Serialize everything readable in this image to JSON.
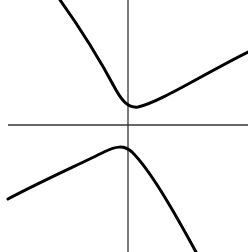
{
  "figure": {
    "type": "hyperbola-sketch",
    "colors": {
      "background": "#ffffff",
      "axis": "#333333",
      "curve": "#000000"
    },
    "axes": {
      "origin_px": [
        128,
        125
      ],
      "x_axis": {
        "from_px": [
          8,
          125
        ],
        "to_px": [
          248,
          125
        ]
      },
      "y_axis": {
        "from_px": [
          128,
          0
        ],
        "to_px": [
          128,
          252
        ]
      },
      "ticks": [],
      "labels": []
    },
    "branches": [
      {
        "name": "upper-branch",
        "extremum": "minimum",
        "extremum_px": [
          136,
          107
        ],
        "path": "M60,0 C80,28 100,60 116,90 C124,104 130,108 138,107 C160,102 200,76 248,52"
      },
      {
        "name": "lower-branch",
        "extremum": "maximum",
        "extremum_px": [
          120,
          146
        ],
        "path": "M8,199 C40,182 80,164 104,152 C116,146 124,145 132,152 C150,170 172,208 196,252"
      }
    ]
  }
}
